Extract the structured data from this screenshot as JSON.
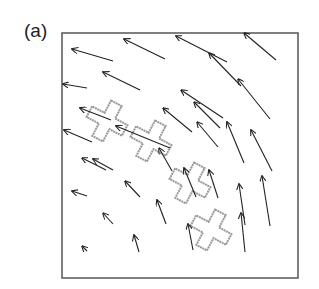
{
  "figure": {
    "panel_label": "(a)",
    "frame": {
      "x": 62,
      "y": 33,
      "width": 236,
      "height": 245,
      "stroke": "#555555"
    },
    "arrow_color": "#222222",
    "marker_color": "#9a9a9a",
    "arrows": [
      {
        "x1": 113,
        "y1": 61,
        "x2": 72,
        "y2": 49
      },
      {
        "x1": 165,
        "y1": 59,
        "x2": 124,
        "y2": 39
      },
      {
        "x1": 87,
        "y1": 88,
        "x2": 63,
        "y2": 84
      },
      {
        "x1": 140,
        "y1": 90,
        "x2": 103,
        "y2": 72
      },
      {
        "x1": 223,
        "y1": 118,
        "x2": 181,
        "y2": 90
      },
      {
        "x1": 227,
        "y1": 62,
        "x2": 176,
        "y2": 36
      },
      {
        "x1": 276,
        "y1": 60,
        "x2": 244,
        "y2": 33
      },
      {
        "x1": 241,
        "y1": 86,
        "x2": 209,
        "y2": 53
      },
      {
        "x1": 270,
        "y1": 119,
        "x2": 238,
        "y2": 79
      },
      {
        "x1": 220,
        "y1": 128,
        "x2": 194,
        "y2": 102
      },
      {
        "x1": 192,
        "y1": 132,
        "x2": 163,
        "y2": 108
      },
      {
        "x1": 218,
        "y1": 147,
        "x2": 197,
        "y2": 122
      },
      {
        "x1": 244,
        "y1": 163,
        "x2": 227,
        "y2": 122
      },
      {
        "x1": 272,
        "y1": 171,
        "x2": 251,
        "y2": 130
      },
      {
        "x1": 111,
        "y1": 120,
        "x2": 80,
        "y2": 108
      },
      {
        "x1": 170,
        "y1": 148,
        "x2": 116,
        "y2": 126
      },
      {
        "x1": 92,
        "y1": 142,
        "x2": 64,
        "y2": 130
      },
      {
        "x1": 106,
        "y1": 170,
        "x2": 82,
        "y2": 158
      },
      {
        "x1": 113,
        "y1": 170,
        "x2": 93,
        "y2": 159
      },
      {
        "x1": 140,
        "y1": 197,
        "x2": 125,
        "y2": 181
      },
      {
        "x1": 87,
        "y1": 196,
        "x2": 72,
        "y2": 191
      },
      {
        "x1": 113,
        "y1": 224,
        "x2": 103,
        "y2": 213
      },
      {
        "x1": 87,
        "y1": 251,
        "x2": 82,
        "y2": 246
      },
      {
        "x1": 139,
        "y1": 252,
        "x2": 134,
        "y2": 235
      },
      {
        "x1": 166,
        "y1": 224,
        "x2": 157,
        "y2": 200
      },
      {
        "x1": 218,
        "y1": 198,
        "x2": 209,
        "y2": 170
      },
      {
        "x1": 172,
        "y1": 171,
        "x2": 159,
        "y2": 148
      },
      {
        "x1": 196,
        "y1": 197,
        "x2": 184,
        "y2": 168
      },
      {
        "x1": 245,
        "y1": 225,
        "x2": 239,
        "y2": 184
      },
      {
        "x1": 270,
        "y1": 226,
        "x2": 262,
        "y2": 176
      },
      {
        "x1": 193,
        "y1": 250,
        "x2": 188,
        "y2": 224
      },
      {
        "x1": 245,
        "y1": 252,
        "x2": 241,
        "y2": 213
      }
    ],
    "crosses": [
      {
        "cx": 107,
        "cy": 121,
        "size": 20,
        "arm": 6,
        "angle": 28
      },
      {
        "cx": 151,
        "cy": 141,
        "size": 20,
        "arm": 6,
        "angle": 28
      },
      {
        "cx": 190,
        "cy": 183,
        "size": 20,
        "arm": 6,
        "angle": 28
      },
      {
        "cx": 211,
        "cy": 230,
        "size": 20,
        "arm": 6,
        "angle": 28
      }
    ]
  }
}
